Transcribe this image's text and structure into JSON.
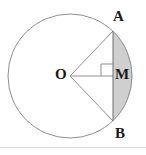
{
  "figure": {
    "background_color": "#ffffff",
    "stroke_color": "#8a8a8a",
    "label_color": "#1a1a1a",
    "segment_fill_color": "#cfcfcf",
    "rule_color": "#e2e2e2",
    "labels": {
      "A": "A",
      "B": "B",
      "M": "M",
      "O": "O"
    },
    "geometry": {
      "circle": {
        "cx": 70,
        "cy": 76,
        "r": 62
      },
      "points": {
        "O": {
          "x": 70,
          "y": 76
        },
        "A": {
          "x": 113,
          "y": 31
        },
        "B": {
          "x": 113,
          "y": 121
        },
        "M": {
          "x": 113,
          "y": 76
        }
      },
      "chord": {
        "x1": 113,
        "y1": 31,
        "x2": 113,
        "y2": 121
      },
      "radius_OA": {
        "x1": 70,
        "y1": 76,
        "x2": 113,
        "y2": 31
      },
      "radius_OB": {
        "x1": 70,
        "y1": 76,
        "x2": 113,
        "y2": 121
      },
      "segment_OM": {
        "x1": 70,
        "y1": 76,
        "x2": 113,
        "y2": 76
      },
      "right_angle_marker": {
        "x": 101,
        "y": 64,
        "size": 12,
        "at": "M"
      },
      "shaded_region": "minor circular segment right of chord AB"
    }
  }
}
